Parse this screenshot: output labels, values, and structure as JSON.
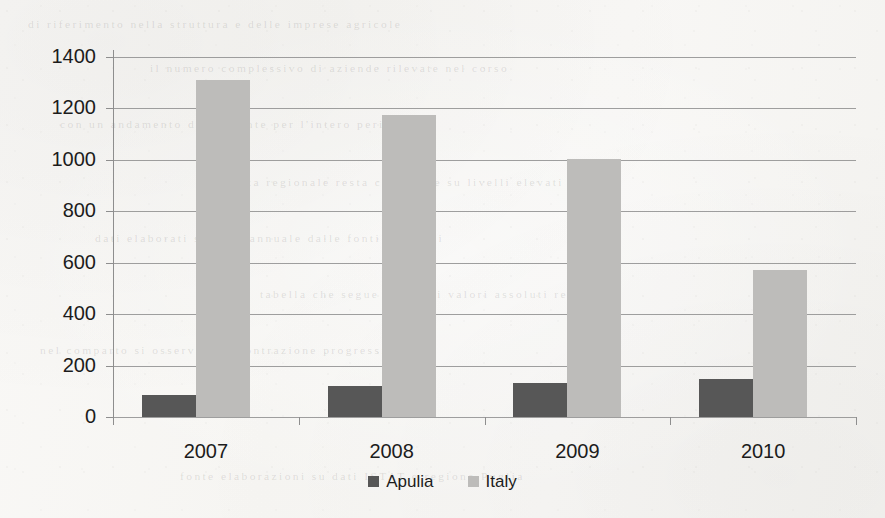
{
  "chart_data": {
    "type": "bar",
    "title": "",
    "subtitle": "",
    "xlabel": "",
    "ylabel": "",
    "categories": [
      "2007",
      "2008",
      "2009",
      "2010"
    ],
    "series": [
      {
        "name": "Apulia",
        "color": "#575757",
        "values": [
          85,
          122,
          132,
          148
        ]
      },
      {
        "name": "Italy",
        "color": "#bdbcba",
        "values": [
          1310,
          1175,
          1005,
          570
        ]
      }
    ],
    "ylim": [
      0,
      1400
    ],
    "ytick_step": 200,
    "yticks": [
      "0",
      "200",
      "400",
      "600",
      "800",
      "1000",
      "1200",
      "1400"
    ],
    "grid": "horizontal",
    "legend_position": "bottom-center",
    "annotations": []
  },
  "legend": {
    "items": [
      {
        "label": "Apulia",
        "swatch": "legend-swatch-apulia"
      },
      {
        "label": "Italy",
        "swatch": "legend-swatch-italy"
      }
    ]
  },
  "background": {
    "paper_color": "#f8f7f5",
    "grid_color": "#8e8e8e",
    "text_color": "#1c1c1c",
    "bleed_through_lines": [
      "di riferimento  nella  struttura  e  delle  imprese  agricole",
      "il numero  complessivo  di  aziende  rilevate  nel  corso",
      "con un  andamento  decrescente  per  l'intero  periodo",
      "la quota  regionale  resta  comunque  su  livelli  elevati",
      "dati  elaborati  su  base  annuale  dalle  fonti  ufficiali",
      "tabella  che  segue  riporta  i  valori  assoluti  registrati",
      "nel  comparto  si  osserva  una  contrazione  progressiva",
      "fonte  elaborazioni  su  dati  ISTAT  e  regione  Puglia"
    ]
  }
}
